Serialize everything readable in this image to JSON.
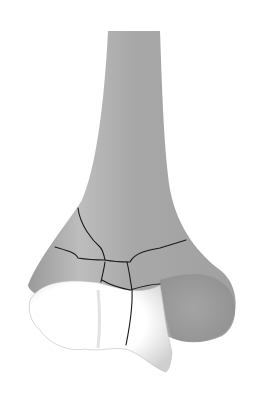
{
  "illustration": {
    "subject": "distal bone with fracture lines",
    "colors": {
      "background": "#ffffff",
      "bone_shaft": "#a9a9a9",
      "bone_shaft_light": "#c4c4c4",
      "bone_shadow": "#8e8e8e",
      "articular_surface": "#ffffff",
      "articular_shade": "#d8d8d8",
      "fracture_line": "#1a1a1a"
    }
  }
}
